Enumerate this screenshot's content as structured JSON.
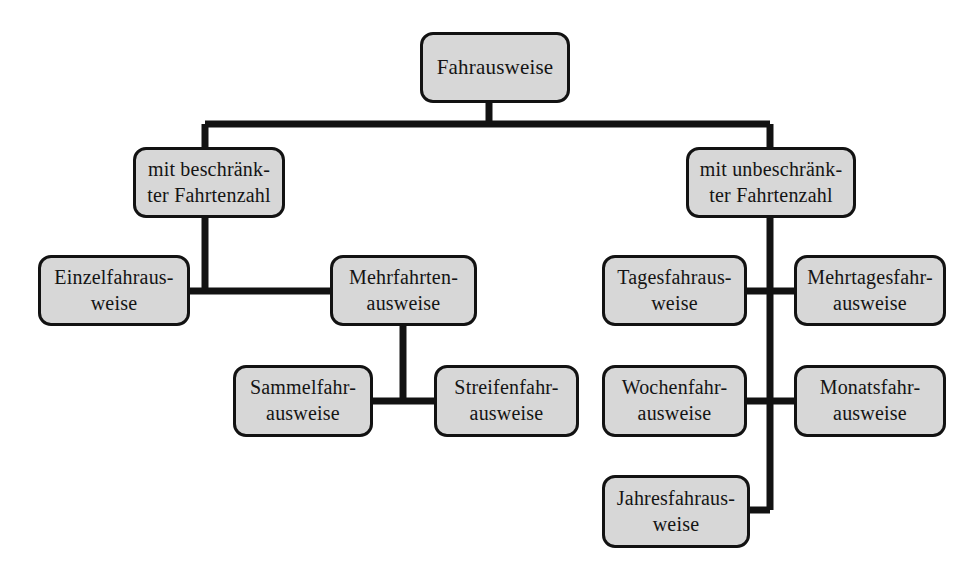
{
  "diagram": {
    "title": "Fahrausweise",
    "type": "hierarchy-tree",
    "colors": {
      "node_fill": "#d7d7d7",
      "node_border": "#121212",
      "connector": "#121212",
      "background": "#ffffff",
      "text": "#141414"
    },
    "nodes": {
      "root": "Fahrausweise",
      "limited": "mit beschränk-\nter Fahrtenzahl",
      "unlimited": "mit unbeschränk-\nter Fahrtenzahl",
      "single": "Einzelfahraus-\nweise",
      "multi": "Mehrfahrten-\nausweise",
      "collective": "Sammelfahr-\nausweise",
      "strip": "Streifenfahr-\nausweise",
      "day": "Tagesfahraus-\nweise",
      "multiday": "Mehrtagesfahr-\nausweise",
      "week": "Wochenfahr-\nausweise",
      "month": "Monatsfahr-\nausweise",
      "year": "Jahresfahraus-\nweise"
    },
    "edges": [
      {
        "from": "root",
        "to": "limited"
      },
      {
        "from": "root",
        "to": "unlimited"
      },
      {
        "from": "limited",
        "to": "single"
      },
      {
        "from": "limited",
        "to": "multi"
      },
      {
        "from": "multi",
        "to": "collective"
      },
      {
        "from": "multi",
        "to": "strip"
      },
      {
        "from": "unlimited",
        "to": "day"
      },
      {
        "from": "unlimited",
        "to": "multiday"
      },
      {
        "from": "unlimited",
        "to": "week"
      },
      {
        "from": "unlimited",
        "to": "month"
      },
      {
        "from": "unlimited",
        "to": "year"
      }
    ]
  }
}
